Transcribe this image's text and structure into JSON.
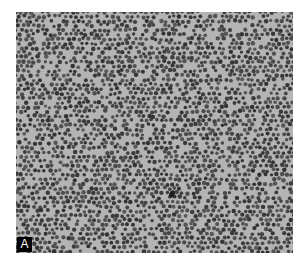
{
  "figure": {
    "panel_label": "A",
    "colors": {
      "background": "#b4b4b4",
      "particle": "#4a4a4a",
      "label_bg": "#000000",
      "label_fg": "#ffffff"
    }
  }
}
